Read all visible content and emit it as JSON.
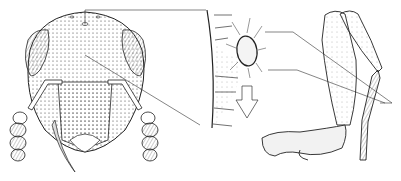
{
  "figure": {
    "panels": [
      {
        "name": "insect-head-frontal-view"
      },
      {
        "name": "cuticle-section-detail"
      },
      {
        "name": "insect-leg-lateral-view"
      }
    ],
    "colors": {
      "ink": "#222222",
      "paper": "#ffffff",
      "shade": "#888888"
    }
  }
}
